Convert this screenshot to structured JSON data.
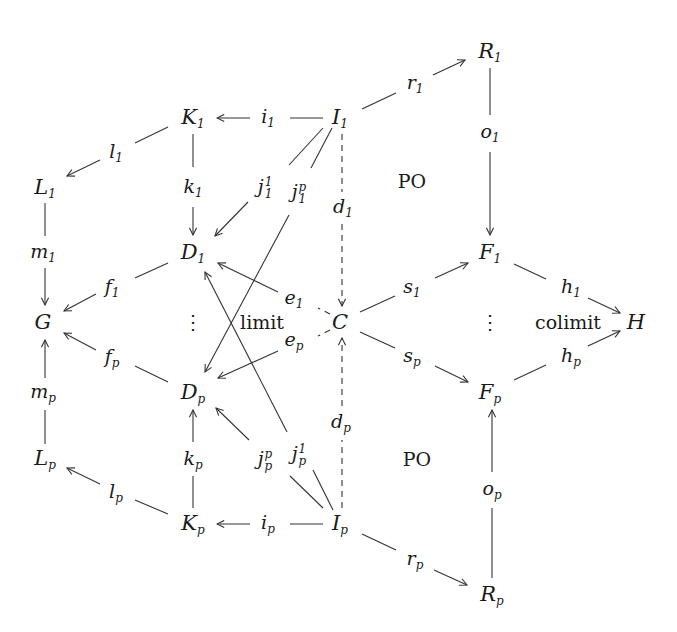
{
  "diagram": {
    "type": "commutative-diagram",
    "nodes": {
      "R1": {
        "base": "R",
        "sub": "1",
        "x": 490,
        "y": 52
      },
      "K1": {
        "base": "K",
        "sub": "1",
        "x": 193,
        "y": 118
      },
      "I1": {
        "base": "I",
        "sub": "1",
        "x": 340,
        "y": 118
      },
      "L1": {
        "base": "L",
        "sub": "1",
        "x": 45,
        "y": 188
      },
      "D1": {
        "base": "D",
        "sub": "1",
        "x": 193,
        "y": 253
      },
      "F1": {
        "base": "F",
        "sub": "1",
        "x": 490,
        "y": 253
      },
      "G": {
        "base": "G",
        "sub": "",
        "x": 43,
        "y": 322
      },
      "C": {
        "base": "C",
        "sub": "",
        "x": 340,
        "y": 322
      },
      "H": {
        "base": "H",
        "sub": "",
        "x": 636,
        "y": 322
      },
      "Dp": {
        "base": "D",
        "sub": "p",
        "x": 193,
        "y": 393
      },
      "Fp": {
        "base": "F",
        "sub": "p",
        "x": 490,
        "y": 393
      },
      "Lp": {
        "base": "L",
        "sub": "p",
        "x": 45,
        "y": 459
      },
      "Kp": {
        "base": "K",
        "sub": "p",
        "x": 193,
        "y": 524
      },
      "Ip": {
        "base": "I",
        "sub": "p",
        "x": 340,
        "y": 524
      },
      "Rp": {
        "base": "R",
        "sub": "p",
        "x": 492,
        "y": 595
      }
    },
    "arrow_labels": {
      "r1": {
        "base": "r",
        "sub": "1",
        "x": 415,
        "y": 84
      },
      "i1": {
        "base": "i",
        "sub": "1",
        "x": 268,
        "y": 118
      },
      "l1": {
        "base": "l",
        "sub": "1",
        "x": 116,
        "y": 153
      },
      "k1": {
        "base": "k",
        "sub": "1",
        "x": 193,
        "y": 188
      },
      "o1": {
        "base": "o",
        "sub": "1",
        "x": 490,
        "y": 133
      },
      "j11": {
        "base": "j",
        "sup": "1",
        "sub": "1",
        "x": 265,
        "y": 188
      },
      "j1p": {
        "base": "j",
        "sup": "p",
        "sub": "1",
        "x": 299,
        "y": 193
      },
      "d1": {
        "base": "d",
        "sub": "1",
        "x": 343,
        "y": 208
      },
      "m1": {
        "base": "m",
        "sub": "1",
        "x": 43,
        "y": 253
      },
      "f1": {
        "base": "f",
        "sub": "1",
        "x": 112,
        "y": 288
      },
      "e1": {
        "base": "e",
        "sub": "1",
        "x": 294,
        "y": 299
      },
      "s1": {
        "base": "s",
        "sub": "1",
        "x": 412,
        "y": 288
      },
      "h1": {
        "base": "h",
        "sub": "1",
        "x": 571,
        "y": 288
      },
      "fp": {
        "base": "f",
        "sub": "p",
        "x": 112,
        "y": 358
      },
      "ep": {
        "base": "e",
        "sub": "p",
        "x": 294,
        "y": 341
      },
      "sp": {
        "base": "s",
        "sub": "p",
        "x": 412,
        "y": 357
      },
      "hp": {
        "base": "h",
        "sub": "p",
        "x": 571,
        "y": 357
      },
      "mp": {
        "base": "m",
        "sub": "p",
        "x": 43,
        "y": 393
      },
      "kp": {
        "base": "k",
        "sub": "p",
        "x": 193,
        "y": 460
      },
      "jpp": {
        "base": "j",
        "sup": "p",
        "sub": "p",
        "x": 265,
        "y": 460
      },
      "jp1": {
        "base": "j",
        "sup": "1",
        "sub": "p",
        "x": 299,
        "y": 455
      },
      "dp": {
        "base": "d",
        "sub": "p",
        "x": 341,
        "y": 423
      },
      "op": {
        "base": "o",
        "sub": "p",
        "x": 492,
        "y": 490
      },
      "lp": {
        "base": "l",
        "sub": "p",
        "x": 116,
        "y": 493
      },
      "ip": {
        "base": "i",
        "sub": "p",
        "x": 268,
        "y": 524
      },
      "rp": {
        "base": "r",
        "sub": "p",
        "x": 415,
        "y": 560
      }
    },
    "annotations": {
      "po_top": {
        "text": "PO",
        "x": 412,
        "y": 181
      },
      "po_bottom": {
        "text": "PO",
        "x": 417,
        "y": 459
      },
      "limit": {
        "text": "limit",
        "x": 262,
        "y": 322
      },
      "colimit": {
        "text": "colimit",
        "x": 568,
        "y": 322
      },
      "vdots_left": {
        "text": "⋮",
        "x": 193,
        "y": 322
      },
      "vdots_right": {
        "text": "⋮",
        "x": 490,
        "y": 322
      }
    },
    "stroke_color": "#333333",
    "background_color": "#ffffff"
  }
}
